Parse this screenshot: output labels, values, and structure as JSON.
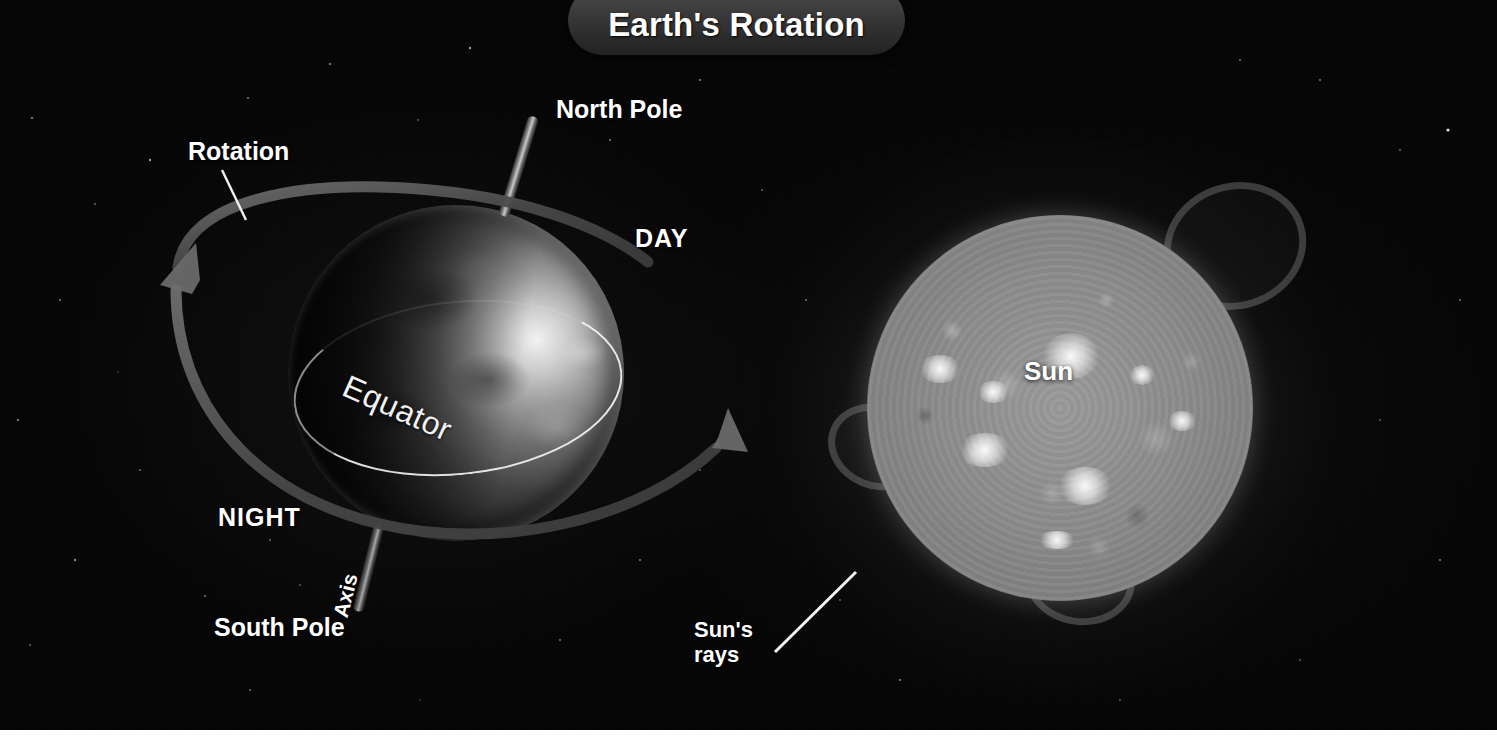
{
  "title": {
    "text": "Earth's Rotation",
    "banner_color": "#3b3b3b",
    "text_color": "#fdfdfd"
  },
  "scene": {
    "background_color": "#050505",
    "bottom_band_color": "#fefefe",
    "description": "Diagram of Earth rotating on its tilted axis beside the Sun, showing day and night sides"
  },
  "labels": {
    "rotation": "Rotation",
    "north_pole": "North Pole",
    "day": "DAY",
    "night": "NIGHT",
    "south_pole": "South Pole",
    "axis": "Axis",
    "equator": "Equator",
    "sun": "Sun",
    "suns_rays_line1": "Sun's",
    "suns_rays_line2": "rays"
  },
  "earth": {
    "lit_side": "DAY",
    "dark_side": "NIGHT",
    "equator_label": "Equator",
    "axis_label": "Axis",
    "poles": [
      "North Pole",
      "South Pole"
    ]
  },
  "sun": {
    "label": "Sun",
    "rays_label": "Sun's rays"
  },
  "arrows": {
    "rotation_direction": "counterclockwise-from-north",
    "arrow_color": "#555555"
  }
}
